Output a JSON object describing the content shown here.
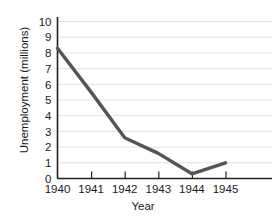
{
  "chart_data": {
    "type": "line",
    "title": "",
    "subtitle": "",
    "xlabel": "Year",
    "ylabel": "Unemployment (millions)",
    "categories": [
      "1940",
      "1941",
      "1942",
      "1943",
      "1944",
      "1945"
    ],
    "x": [
      1940,
      1941,
      1942,
      1943,
      1944,
      1945
    ],
    "values": [
      8.3,
      5.5,
      2.6,
      1.6,
      0.3,
      1.0
    ],
    "series": [
      {
        "name": "Unemployment",
        "values": [
          8.3,
          5.5,
          2.6,
          1.6,
          0.3,
          1.0
        ]
      }
    ],
    "ylim": [
      0,
      10
    ],
    "yticks": [
      "0",
      "1",
      "2",
      "3",
      "4",
      "5",
      "6",
      "7",
      "8",
      "9",
      "10"
    ],
    "xticks": [
      "1940",
      "1941",
      "1942",
      "1943",
      "1944",
      "1945"
    ],
    "grid": "horizontal",
    "legend": "none",
    "annotations": [],
    "colors": {
      "line": "#555555",
      "axis": "#222222",
      "grid": "#e2e2e2",
      "background": "#ffffff",
      "text": "#1a1a1a"
    }
  }
}
